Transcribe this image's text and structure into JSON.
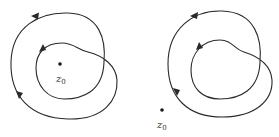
{
  "figures": [
    {
      "id": "left",
      "description": "Closed curve winding twice around z0 (z0 inside both loops)",
      "point_label": "z",
      "point_subscript": "0"
    },
    {
      "id": "right",
      "description": "Closed curve winding twice, z0 outside the curve",
      "point_label": "z",
      "point_subscript": "0"
    }
  ],
  "colors": {
    "stroke": "#2a2a2a",
    "background": "#ffffff"
  }
}
